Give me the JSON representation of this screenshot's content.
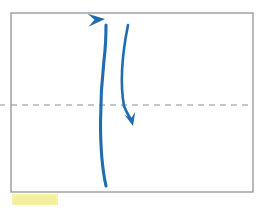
{
  "canvas": {
    "width": 261,
    "height": 208,
    "background_color": "#ffffff"
  },
  "frame": {
    "name": "diagram-frame",
    "x": 11,
    "y": 13,
    "width": 242,
    "height": 179,
    "stroke_color": "#8a8a8a",
    "stroke_width": 1.2,
    "fill_color": "#ffffff"
  },
  "axis": {
    "name": "horizontal-dashed-axis",
    "y": 105,
    "x_start": 0,
    "x_end": 253,
    "stroke_color": "#8d8d8d",
    "stroke_width": 1,
    "dash_pattern": "6 5",
    "stub_left": {
      "x_start": 0,
      "x_end": 5
    }
  },
  "arrows": [
    {
      "name": "upward-curved-arrow",
      "direction": "up",
      "color": "#1f6cb0",
      "stroke_width": 3.1,
      "path": "M 106 186 C 98 150 100 96 104 60 C 106 44 106 33 106 25",
      "head": {
        "tip_x": 105,
        "tip_y": 19,
        "angle_deg": -4,
        "length": 17,
        "half_width": 6.5
      }
    },
    {
      "name": "downward-curved-arrow",
      "direction": "down",
      "color": "#1f6cb0",
      "stroke_width": 2.6,
      "path": "M 128 25 C 122 55 120 84 124 106 C 127 114 130 118 132 121",
      "head": {
        "tip_x": 133,
        "tip_y": 126,
        "angle_deg": 76,
        "length": 13,
        "half_width": 5.5
      }
    }
  ],
  "highlight": {
    "name": "yellow-highlighter-mark",
    "x": 12,
    "y": 194,
    "width": 46,
    "height": 11,
    "color": "#f6f1a9"
  },
  "labels": {
    "figure_title": "",
    "axis_label": "",
    "caption": ""
  }
}
